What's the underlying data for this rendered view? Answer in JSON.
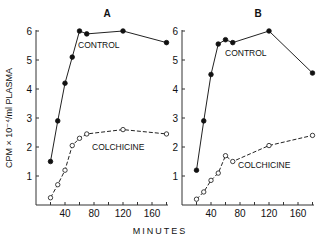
{
  "figure": {
    "ylabel": "CPM × 10⁻⁴/ml PLASMA",
    "xlabel": "MINUTES",
    "panels": [
      {
        "label": "A",
        "control_label": "CONTROL",
        "colchicine_label": "COLCHICINE"
      },
      {
        "label": "B",
        "control_label": "CONTROL",
        "colchicine_label": "COLCHICINE"
      }
    ],
    "ytick_labels": [
      "1",
      "2",
      "3",
      "4",
      "5",
      "6"
    ],
    "xtick_labels": [
      "40",
      "80",
      "120",
      "160"
    ]
  },
  "chart_data": [
    {
      "type": "line",
      "title": "A",
      "xlabel": "MINUTES",
      "ylabel": "CPM × 10⁻⁴/ml PLASMA",
      "xlim": [
        0,
        180
      ],
      "ylim": [
        0,
        6
      ],
      "xticks": [
        20,
        40,
        60,
        80,
        100,
        120,
        140,
        160,
        180
      ],
      "xtick_labels": [
        "40",
        "80",
        "120",
        "160"
      ],
      "yticks": [
        1,
        2,
        3,
        4,
        5,
        6
      ],
      "series": [
        {
          "name": "CONTROL",
          "style": "solid, filled circles",
          "x": [
            20,
            30,
            40,
            50,
            60,
            70,
            120,
            180
          ],
          "values": [
            1.5,
            2.9,
            4.2,
            5.1,
            6.0,
            5.9,
            6.0,
            5.6
          ]
        },
        {
          "name": "COLCHICINE",
          "style": "dashed, open circles",
          "x": [
            20,
            30,
            40,
            50,
            60,
            70,
            120,
            180
          ],
          "values": [
            0.25,
            0.7,
            1.2,
            2.05,
            2.3,
            2.45,
            2.6,
            2.45
          ]
        }
      ]
    },
    {
      "type": "line",
      "title": "B",
      "xlabel": "MINUTES",
      "ylabel": "CPM × 10⁻⁴/ml PLASMA",
      "xlim": [
        0,
        180
      ],
      "ylim": [
        0,
        6
      ],
      "xticks": [
        20,
        40,
        60,
        80,
        100,
        120,
        140,
        160,
        180
      ],
      "xtick_labels": [
        "40",
        "80",
        "120",
        "160"
      ],
      "yticks": [
        1,
        2,
        3,
        4,
        5,
        6
      ],
      "series": [
        {
          "name": "CONTROL",
          "style": "solid, filled circles",
          "x": [
            20,
            30,
            40,
            50,
            60,
            70,
            120,
            180
          ],
          "values": [
            1.2,
            2.9,
            4.5,
            5.55,
            5.7,
            5.6,
            6.0,
            4.55
          ]
        },
        {
          "name": "COLCHICINE",
          "style": "dashed, open circles",
          "x": [
            20,
            30,
            40,
            50,
            60,
            70,
            120,
            180
          ],
          "values": [
            0.2,
            0.45,
            0.85,
            1.1,
            1.7,
            1.5,
            2.05,
            2.4
          ]
        }
      ]
    }
  ]
}
